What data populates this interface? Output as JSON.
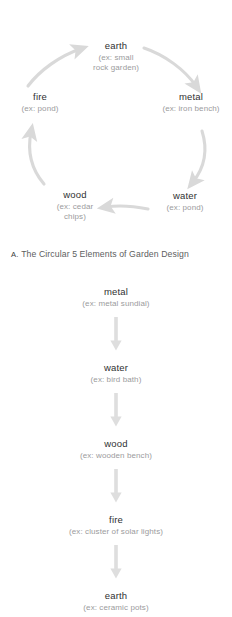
{
  "figure_a": {
    "caption_letter": "A.",
    "caption_text": "The Circular 5 Elements of Garden Design",
    "arrow_color": "#dcdcdc",
    "name_color": "#2f3031",
    "example_color": "#9b9b9d",
    "nodes": [
      {
        "id": "earth",
        "name": "earth",
        "example": "(ex: small",
        "example2": "rock garden)"
      },
      {
        "id": "metal",
        "name": "metal",
        "example": "(ex: iron bench)",
        "example2": ""
      },
      {
        "id": "water",
        "name": "water",
        "example": "(ex: pond)",
        "example2": ""
      },
      {
        "id": "wood",
        "name": "wood",
        "example": "(ex: cedar",
        "example2": "chips)"
      },
      {
        "id": "fire",
        "name": "fire",
        "example": "(ex: pond)",
        "example2": ""
      }
    ],
    "arrows": [
      {
        "from": "fire",
        "to": "earth"
      },
      {
        "from": "earth",
        "to": "metal"
      },
      {
        "from": "metal",
        "to": "water"
      },
      {
        "from": "water",
        "to": "wood"
      },
      {
        "from": "wood",
        "to": "fire"
      }
    ]
  },
  "figure_b": {
    "arrow_color": "#dcdcdc",
    "nodes": [
      {
        "id": "metal",
        "name": "metal",
        "example": "(ex: metal sundial)"
      },
      {
        "id": "water",
        "name": "water",
        "example": "(ex: bird bath)"
      },
      {
        "id": "wood",
        "name": "wood",
        "example": "(ex: wooden bench)"
      },
      {
        "id": "fire",
        "name": "fire",
        "example": "(ex: cluster of solar lights)"
      },
      {
        "id": "earth",
        "name": "earth",
        "example": "(ex: ceramic pots)"
      }
    ]
  }
}
